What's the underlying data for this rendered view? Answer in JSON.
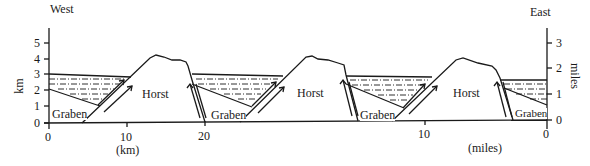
{
  "directions": {
    "west": "West",
    "east": "East"
  },
  "left_axis": {
    "label": "km",
    "ticks": [
      "0",
      "1",
      "2",
      "3",
      "4",
      "5"
    ]
  },
  "right_axis": {
    "label": "miles",
    "ticks": [
      "0",
      "1",
      "2",
      "3"
    ]
  },
  "bottom_km_axis": {
    "unit_label": "(km)",
    "ticks": [
      "0",
      "10",
      "20"
    ]
  },
  "bottom_miles_axis": {
    "unit_label": "(miles)",
    "ticks": [
      "10",
      "0"
    ]
  },
  "regions": {
    "graben_1": "Graben",
    "horst_1": "Horst",
    "graben_2": "Graben",
    "horst_2": "Horst",
    "graben_3": "Graben",
    "horst_3": "Horst",
    "graben_4": "Graben"
  },
  "colors": {
    "line": "#1a1a1a",
    "background": "#ffffff"
  }
}
